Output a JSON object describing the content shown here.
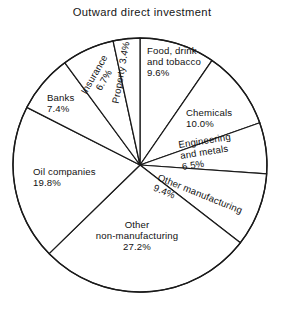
{
  "chart_data": {
    "type": "pie",
    "title": "Outward direct investment",
    "xlabel": "",
    "ylabel": "",
    "units": "percent",
    "total": 100.0,
    "legend": "none",
    "grid": false,
    "start_angle_deg": 0,
    "direction": "clockwise",
    "categories": [
      "Food, drink and tobacco",
      "Chemicals",
      "Engineering and metals",
      "Other manufacturing",
      "Other non-manufacturing",
      "Oil companies",
      "Banks",
      "Insurance",
      "Property"
    ],
    "values": [
      9.6,
      10.0,
      6.5,
      9.4,
      27.2,
      19.8,
      7.4,
      6.7,
      3.4
    ],
    "slices": [
      {
        "label": "Food, drink and tobacco",
        "value": 9.6,
        "value_text": "9.6%",
        "lines": [
          "Food, drink",
          "and tobacco",
          "9.6%"
        ],
        "label_rotation_deg": 0,
        "label_anchor": "start",
        "label_x": 147,
        "label_y": 54,
        "start_deg": 0,
        "end_deg": 34.56
      },
      {
        "label": "Chemicals",
        "value": 10.0,
        "value_text": "10.0%",
        "lines": [
          "Chemicals",
          "10.0%"
        ],
        "label_rotation_deg": 0,
        "label_anchor": "start",
        "label_x": 186,
        "label_y": 116,
        "start_deg": 34.56,
        "end_deg": 70.56
      },
      {
        "label": "Engineering and metals",
        "value": 6.5,
        "value_text": "6.5%",
        "lines": [
          "Engineering",
          "and metals",
          "6.5%"
        ],
        "label_rotation_deg": -9,
        "label_anchor": "start",
        "label_x": 179,
        "label_y": 148,
        "start_deg": 70.56,
        "end_deg": 93.96
      },
      {
        "label": "Other manufacturing",
        "value": 9.4,
        "value_text": "9.4%",
        "lines": [
          "Other manufacturing",
          "9.4%"
        ],
        "label_rotation_deg": 22,
        "label_anchor": "start",
        "label_x": 157,
        "label_y": 180,
        "start_deg": 93.96,
        "end_deg": 127.8
      },
      {
        "label": "Other non-manufacturing",
        "value": 27.2,
        "value_text": "27.2%",
        "lines": [
          "Other",
          "non-manufacturing",
          "27.2%"
        ],
        "label_rotation_deg": 0,
        "label_anchor": "middle",
        "label_x": 137,
        "label_y": 228,
        "start_deg": 127.8,
        "end_deg": 225.72
      },
      {
        "label": "Oil companies",
        "value": 19.8,
        "value_text": "19.8%",
        "lines": [
          "Oil companies",
          "19.8%"
        ],
        "label_rotation_deg": 0,
        "label_anchor": "start",
        "label_x": 33,
        "label_y": 175,
        "start_deg": 225.72,
        "end_deg": 297.0
      },
      {
        "label": "Banks",
        "value": 7.4,
        "value_text": "7.4%",
        "lines": [
          "Banks",
          "7.4%"
        ],
        "label_rotation_deg": 0,
        "label_anchor": "start",
        "label_x": 47,
        "label_y": 101,
        "start_deg": 297.0,
        "end_deg": 323.64
      },
      {
        "label": "Insurance",
        "value": 6.7,
        "value_text": "6.7%",
        "lines": [
          "Insurance",
          "6.7%"
        ],
        "label_rotation_deg": -60,
        "label_anchor": "middle",
        "label_x": 97,
        "label_y": 76,
        "start_deg": 323.64,
        "end_deg": 347.76
      },
      {
        "label": "Property",
        "value": 3.4,
        "value_text": "3.4%",
        "lines": [
          "Property 3.4%"
        ],
        "label_rotation_deg": -80,
        "label_anchor": "middle",
        "label_x": 124,
        "label_y": 73,
        "start_deg": 347.76,
        "end_deg": 360
      }
    ],
    "geometry": {
      "center_x": 140,
      "center_y": 165,
      "radius": 127
    },
    "colors": {
      "background": "#ffffff",
      "slice_fill": "#ffffff",
      "stroke": "#1a1a1a",
      "text": "#111111"
    }
  }
}
